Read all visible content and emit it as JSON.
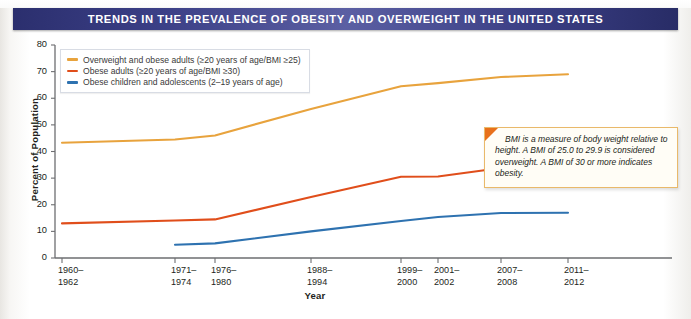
{
  "title": "TRENDS IN THE PREVALENCE OF OBESITY AND OVERWEIGHT IN THE UNITED STATES",
  "callout": {
    "text": "BMI is a measure of body weight relative to height. A BMI of 25.0 to 29.9 is considered overweight.  A BMI of 30 or more indicates obesity."
  },
  "colors": {
    "overweight_adults": "#E8A33D",
    "obese_adults": "#E04E1B",
    "obese_children": "#2E72B0",
    "title_bar": "#3b3f86",
    "axis": "#6d6e71"
  },
  "chart_data": {
    "type": "line",
    "title": "TRENDS IN THE PREVALENCE OF OBESITY AND OVERWEIGHT IN THE UNITED STATES",
    "xlabel": "Year",
    "ylabel": "Percent of Population",
    "ylim": [
      0,
      80
    ],
    "yticks": [
      0,
      10,
      20,
      30,
      40,
      50,
      60,
      70,
      80
    ],
    "grid": false,
    "legend_position": "top-left",
    "categories": [
      "1960–1962",
      "1971–1974",
      "1976–1980",
      "1988–1994",
      "1999–2000",
      "2001–2002",
      "2007–2008",
      "2011–2012"
    ],
    "category_positions": [
      62,
      175,
      215,
      311,
      401,
      438,
      501,
      568
    ],
    "series": [
      {
        "name": "Overweight and obese adults (≥20 years of age/BMI ≥25)",
        "color": "#E8A33D",
        "values": [
          43.3,
          44.5,
          46.0,
          56.0,
          64.5,
          65.7,
          68.0,
          69.0
        ]
      },
      {
        "name": "Obese adults (≥20 years of age/BMI ≥30)",
        "color": "#E04E1B",
        "values": [
          13.0,
          14.1,
          14.5,
          22.9,
          30.5,
          30.6,
          33.8,
          35.1
        ]
      },
      {
        "name": "Obese children and adolescents (2–19 years of age)",
        "color": "#2E72B0",
        "values": [
          null,
          5.0,
          5.5,
          10.0,
          13.9,
          15.4,
          16.9,
          17.0
        ]
      }
    ]
  },
  "legend": [
    {
      "label": "Overweight and obese adults (≥20 years of age/BMI ≥25)",
      "color": "#E8A33D"
    },
    {
      "label": "Obese adults (≥20 years of age/BMI ≥30)",
      "color": "#E04E1B"
    },
    {
      "label": "Obese children and adolescents (2–19 years of age)",
      "color": "#2E72B0"
    }
  ],
  "axes": {
    "y_ticks": [
      "80",
      "70",
      "60",
      "50",
      "40",
      "30",
      "20",
      "10",
      "0"
    ],
    "x_ticks": [
      {
        "line1": "1960–",
        "line2": "1962"
      },
      {
        "line1": "1971–",
        "line2": "1974"
      },
      {
        "line1": "1976–",
        "line2": "1980"
      },
      {
        "line1": "1988–",
        "line2": "1994"
      },
      {
        "line1": "1999–",
        "line2": "2000"
      },
      {
        "line1": "2001–",
        "line2": "2002"
      },
      {
        "line1": "2007–",
        "line2": "2008"
      },
      {
        "line1": "2011–",
        "line2": "2012"
      }
    ],
    "ylabel": "Percent of Population",
    "xlabel": "Year"
  }
}
